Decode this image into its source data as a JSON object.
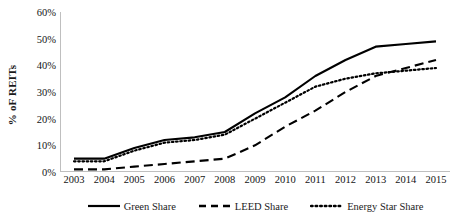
{
  "chart_data": {
    "type": "line",
    "title": "",
    "xlabel": "",
    "ylabel": "% oF REITs",
    "categories": [
      "2003",
      "2004",
      "2005",
      "2006",
      "2007",
      "2008",
      "2009",
      "2010",
      "2011",
      "2012",
      "2013",
      "2014",
      "2015"
    ],
    "x": [
      2003,
      2004,
      2005,
      2006,
      2007,
      2008,
      2009,
      2010,
      2011,
      2012,
      2013,
      2014,
      2015
    ],
    "series": [
      {
        "name": "Green Share",
        "style": "solid",
        "color": "#000000",
        "values": [
          5,
          5,
          9,
          12,
          13,
          15,
          22,
          28,
          36,
          42,
          47,
          48,
          49
        ]
      },
      {
        "name": "LEED Share",
        "style": "dashed",
        "color": "#000000",
        "values": [
          1,
          1,
          2,
          3,
          4,
          5,
          10,
          17,
          23,
          30,
          36,
          39,
          42
        ]
      },
      {
        "name": "Energy Star Share",
        "style": "dotted",
        "color": "#000000",
        "values": [
          4,
          4,
          8,
          11,
          12,
          14,
          20,
          26,
          32,
          35,
          37,
          38,
          39
        ]
      }
    ],
    "ylim": [
      0,
      60
    ],
    "ytick_values": [
      0,
      10,
      20,
      30,
      40,
      50,
      60
    ],
    "ytick_labels": [
      "0%",
      "10%",
      "20%",
      "30%",
      "40%",
      "50%",
      "60%"
    ],
    "grid": false,
    "legend_position": "bottom",
    "axis_color": "#bfbfbf"
  }
}
